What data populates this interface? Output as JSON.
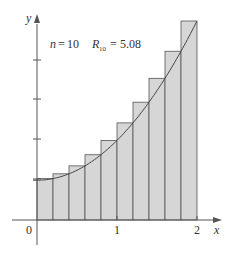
{
  "chart_data": {
    "type": "bar",
    "title": "",
    "annotation": {
      "n_label": "n",
      "n_value": "10",
      "r_label": "R",
      "r_sub": "10",
      "r_value": "5.08"
    },
    "function": "f(x) = x^2 + 1",
    "xlabel": "x",
    "ylabel": "y",
    "x_ticks": [
      "0",
      "1",
      "2"
    ],
    "xlim": [
      0,
      2
    ],
    "ylim": [
      0,
      5
    ],
    "categories": [
      "0.2",
      "0.4",
      "0.6",
      "0.8",
      "1.0",
      "1.2",
      "1.4",
      "1.6",
      "1.8",
      "2.0"
    ],
    "values": [
      1.04,
      1.16,
      1.36,
      1.64,
      2.0,
      2.44,
      2.96,
      3.56,
      4.24,
      5.0
    ],
    "grid": false,
    "colors": {
      "bar_fill": "#d6d6d6",
      "bar_stroke": "#555555",
      "curve": "#444444",
      "axis": "#555555"
    }
  }
}
